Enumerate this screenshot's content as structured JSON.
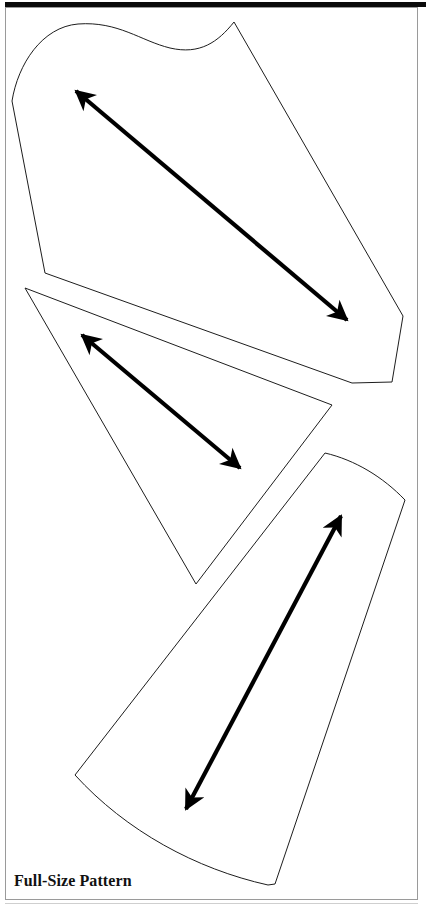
{
  "figure": {
    "caption": "Full-Size Pattern",
    "background_color": "#ffffff",
    "outline_color": "#1d1d1d",
    "grainline_color": "#000000",
    "frame_color": "#9a9a9a",
    "top_rule_color": "#0a0a0a"
  },
  "pieces": [
    {
      "id": "piece-top",
      "name": "upper-pattern-piece",
      "outline_path": "M 12,101 C 18,64 42,27 78,24 C 118,21 141,41 170,48 C 200,55 218,42 234,22 L 403,316 L 392,382 L 352,383 L 45,273 Z",
      "grainline": {
        "from_x": 347,
        "from_y": 320,
        "to_x": 76,
        "to_y": 91,
        "arrow_at": "both-ends",
        "head_start": true,
        "head_end": true
      }
    },
    {
      "id": "piece-middle",
      "name": "middle-triangle-piece",
      "outline_path": "M 25,288 L 332,405 L 196,584 Z",
      "grainline": {
        "from_x": 240,
        "from_y": 468,
        "to_x": 82,
        "to_y": 335,
        "arrow_at": "both-ends",
        "head_start": true,
        "head_end": true
      }
    },
    {
      "id": "piece-bottom",
      "name": "lower-flared-piece",
      "outline_path": "M 325,453 C 355,460 383,477 405,500 L 275,884 L 268,885 C 196,869 126,831 75,775 Z",
      "grainline": {
        "from_x": 186,
        "from_y": 809,
        "to_x": 341,
        "to_y": 516,
        "arrow_at": "both-ends",
        "head_start": true,
        "head_end": true
      }
    }
  ],
  "annotations": {
    "grainline_label": "grainline-arrow",
    "piece_count": 3
  }
}
